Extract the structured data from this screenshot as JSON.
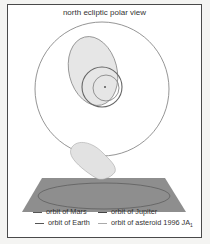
{
  "title": "north ecliptic polar view",
  "legend": {
    "mars": "orbit of Mars",
    "jupiter": "orbit of Jupiter",
    "earth": "orbit of Earth",
    "asteroid": "orbit of asteroid 1996 JA",
    "asteroid_sub": "1"
  },
  "colors": {
    "frame": "#4a4a4a",
    "asteroid_fill": "#e4e4e4",
    "plane_fill": "#8e8e8e",
    "orbit_line": "#777777"
  }
}
